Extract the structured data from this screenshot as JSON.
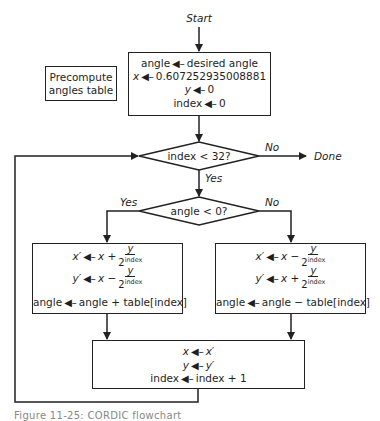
{
  "diagram": {
    "start_label": "Start",
    "init_box": {
      "lines": [
        {
          "lhs": "angle",
          "rhs": "desired angle"
        },
        {
          "lhs": "x",
          "rhs": "0.607252935008881"
        },
        {
          "lhs": "y",
          "rhs": "0"
        },
        {
          "lhs": "index",
          "rhs": "0"
        }
      ]
    },
    "precompute_box": {
      "line1": "Precompute",
      "line2": "angles table"
    },
    "decision_loop": {
      "text": "index < 32?",
      "yes": "Yes",
      "no": "No",
      "no_target": "Done"
    },
    "decision_angle": {
      "text": "angle < 0?",
      "yes": "Yes",
      "no": "No"
    },
    "left_box": {
      "x_lhs": "x′",
      "x_rhs_var": "x",
      "x_op": "+",
      "x_num": "y",
      "x_den": "2",
      "x_exp": "index",
      "y_lhs": "y′",
      "y_rhs_var": "x",
      "y_op": "−",
      "y_num": "y",
      "y_den": "2",
      "y_exp": "index",
      "angle_lhs": "angle",
      "angle_rhs": "angle + table[index]"
    },
    "right_box": {
      "x_lhs": "x′",
      "x_rhs_var": "x",
      "x_op": "−",
      "x_num": "y",
      "x_den": "2",
      "x_exp": "index",
      "y_lhs": "y′",
      "y_rhs_var": "x",
      "y_op": "+",
      "y_num": "y",
      "y_den": "2",
      "y_exp": "index",
      "angle_lhs": "angle",
      "angle_rhs": "angle − table[index]"
    },
    "update_box": {
      "lines": [
        {
          "lhs": "x",
          "rhs": "x′"
        },
        {
          "lhs": "y",
          "rhs": "y′"
        },
        {
          "lhs": "index",
          "rhs": "index + 1"
        }
      ]
    },
    "caption": "Figure 11-25: CORDIC flowchart",
    "arrow_glyph": "◀—",
    "stroke_color": "#222222"
  }
}
